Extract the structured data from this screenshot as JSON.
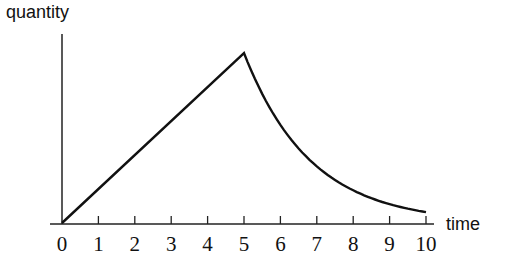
{
  "chart_data": {
    "type": "line",
    "title": "",
    "xlabel": "time",
    "ylabel": "quantity",
    "x_ticks": [
      "0",
      "1",
      "2",
      "3",
      "4",
      "5",
      "6",
      "7",
      "8",
      "9",
      "10"
    ],
    "xlim": [
      0,
      10
    ],
    "grid": false,
    "legend": null,
    "series": [
      {
        "name": "quantity",
        "description": "linear increase from 0 to peak at t=5, then exponential decay",
        "x": [
          0,
          1,
          2,
          3,
          4,
          5,
          6,
          7,
          8,
          9,
          10
        ],
        "y": [
          0,
          1,
          2,
          3,
          4,
          5,
          3.1,
          1.85,
          1.06,
          0.62,
          0.32
        ]
      }
    ],
    "colors": {
      "line": "#111111",
      "axis": "#222222",
      "background": "#ffffff"
    }
  },
  "labels": {
    "y_axis": "quantity",
    "x_axis": "time",
    "ticks": [
      "0",
      "1",
      "2",
      "3",
      "4",
      "5",
      "6",
      "7",
      "8",
      "9",
      "10"
    ]
  }
}
